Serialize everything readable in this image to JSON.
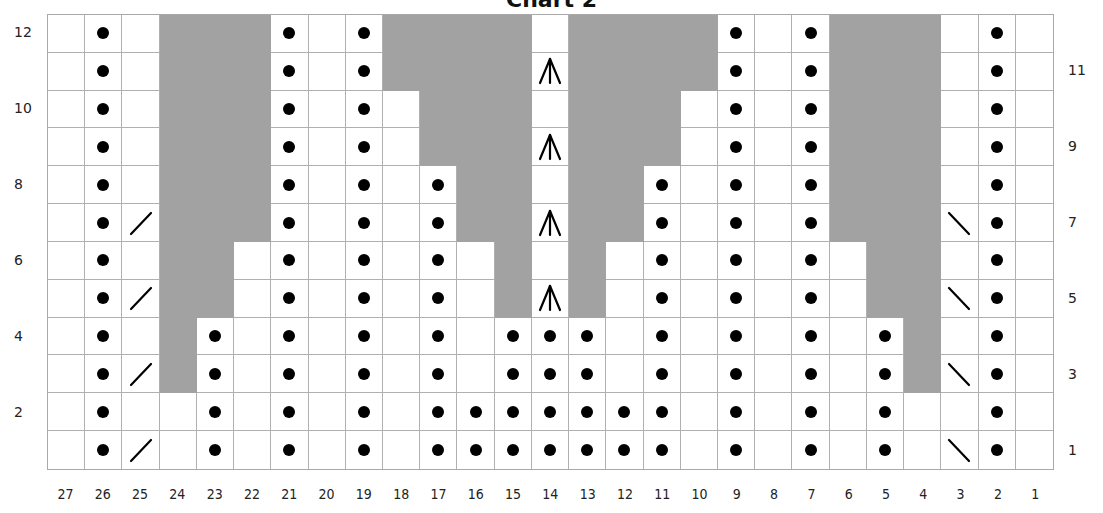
{
  "title": "Chart 2",
  "chart_data": {
    "type": "table",
    "title": "Chart 2",
    "columns": [
      27,
      26,
      25,
      24,
      23,
      22,
      21,
      20,
      19,
      18,
      17,
      16,
      15,
      14,
      13,
      12,
      11,
      10,
      9,
      8,
      7,
      6,
      5,
      4,
      3,
      2,
      1
    ],
    "rows_top_to_bottom": [
      12,
      11,
      10,
      9,
      8,
      7,
      6,
      5,
      4,
      3,
      2,
      1
    ],
    "left_row_labels": [
      "12",
      "10",
      "8",
      "6",
      "4",
      "2"
    ],
    "right_row_labels": [
      "11",
      "9",
      "7",
      "5",
      "3",
      "1"
    ],
    "legend": {
      ".": "knit (empty square)",
      "o": "purl (dot)",
      "/": "right-slanting decrease",
      "\\": "left-slanting decrease",
      "A": "centered multi-stitch decrease",
      "#": "no stitch (shaded)"
    },
    "grid": [
      ".o.###o.o##########o.o####.o.",
      ".o.###o.o###A######o.o####.o.",
      ".o.###o.o.##.#####.o.o####.o.",
      ".o.###o.o.##A#####.o.o####.o.",
      ".o.###o.o.o#.##o.o.o.o####.o.",
      ".o/###o.o.o#A##o.o.o.o####\\o.",
      ".o.##.o.o.o.#.#.o.o.o.o.###.o.",
      ".o/##.o.o.o.#A#.o.o.o.o.###\\o.",
      ".o.#o.o.o.o.oooo.o.o.o.o.#.o.",
      ".o/#o.o.o.o.oooo.o.o.o.o.#\\o.",
      ".o..o.o.oooooooo.o.o.o.o...o.",
      ".o/.o.o.oooooooo.o.o.o.o..\\o."
    ],
    "cells": {
      "row12": [
        ".",
        "o",
        ".",
        "#",
        "#",
        "#",
        "o",
        ".",
        "o",
        "#",
        "#",
        "#",
        "#",
        ".",
        "#",
        "#",
        "#",
        "#",
        "o",
        ".",
        "o",
        "#",
        "#",
        "#",
        ".",
        "o",
        "."
      ],
      "row11": [
        ".",
        "o",
        ".",
        "#",
        "#",
        "#",
        "o",
        ".",
        "o",
        "#",
        "#",
        "#",
        "#",
        "A",
        "#",
        "#",
        "#",
        "#",
        "o",
        ".",
        "o",
        "#",
        "#",
        "#",
        ".",
        "o",
        "."
      ],
      "row10": [
        ".",
        "o",
        ".",
        "#",
        "#",
        "#",
        "o",
        ".",
        "o",
        ".",
        "#",
        "#",
        "#",
        ".",
        "#",
        "#",
        "#",
        ".",
        "o",
        ".",
        "o",
        "#",
        "#",
        "#",
        ".",
        "o",
        "."
      ],
      "row9": [
        ".",
        "o",
        ".",
        "#",
        "#",
        "#",
        "o",
        ".",
        "o",
        ".",
        "#",
        "#",
        "#",
        "A",
        "#",
        "#",
        "#",
        ".",
        "o",
        ".",
        "o",
        "#",
        "#",
        "#",
        ".",
        "o",
        "."
      ],
      "row8": [
        ".",
        "o",
        ".",
        "#",
        "#",
        "#",
        "o",
        ".",
        "o",
        ".",
        "o",
        "#",
        "#",
        ".",
        "#",
        "#",
        "o",
        ".",
        "o",
        ".",
        "o",
        "#",
        "#",
        "#",
        ".",
        "o",
        "."
      ],
      "row7": [
        ".",
        "o",
        "/",
        "#",
        "#",
        "#",
        "o",
        ".",
        "o",
        ".",
        "o",
        "#",
        "#",
        "A",
        "#",
        "#",
        "o",
        ".",
        "o",
        ".",
        "o",
        "#",
        "#",
        "#",
        "\\",
        "o",
        "."
      ],
      "row6": [
        ".",
        "o",
        ".",
        "#",
        "#",
        ".",
        "o",
        ".",
        "o",
        ".",
        "o",
        ".",
        "#",
        ".",
        "#",
        ".",
        "o",
        ".",
        "o",
        ".",
        "o",
        ".",
        "#",
        "#",
        ".",
        "o",
        "."
      ],
      "row5": [
        ".",
        "o",
        "/",
        "#",
        "#",
        ".",
        "o",
        ".",
        "o",
        ".",
        "o",
        ".",
        "#",
        "A",
        "#",
        ".",
        "o",
        ".",
        "o",
        ".",
        "o",
        ".",
        "#",
        "#",
        "\\",
        "o",
        "."
      ],
      "row4": [
        ".",
        "o",
        ".",
        "#",
        "o",
        ".",
        "o",
        ".",
        "o",
        ".",
        "o",
        ".",
        "o",
        "o",
        "o",
        ".",
        "o",
        ".",
        "o",
        ".",
        "o",
        ".",
        "o",
        "#",
        ".",
        "o",
        "."
      ],
      "row3": [
        ".",
        "o",
        "/",
        "#",
        "o",
        ".",
        "o",
        ".",
        "o",
        ".",
        "o",
        ".",
        "o",
        "o",
        "o",
        ".",
        "o",
        ".",
        "o",
        ".",
        "o",
        ".",
        "o",
        "#",
        "\\",
        "o",
        "."
      ],
      "row2": [
        ".",
        "o",
        ".",
        ".",
        "o",
        ".",
        "o",
        ".",
        "o",
        ".",
        "o",
        "o",
        "o",
        "o",
        "o",
        "o",
        "o",
        ".",
        "o",
        ".",
        "o",
        ".",
        "o",
        ".",
        ".",
        "o",
        "."
      ],
      "row1": [
        ".",
        "o",
        "/",
        ".",
        "o",
        ".",
        "o",
        ".",
        "o",
        ".",
        "o",
        "o",
        "o",
        "o",
        "o",
        "o",
        "o",
        ".",
        "o",
        ".",
        "o",
        ".",
        "o",
        ".",
        "\\",
        "o",
        "."
      ]
    },
    "colors": {
      "shaded": "#a2a2a2",
      "gridline": "#b0b0b0",
      "symbol": "#000000"
    }
  }
}
